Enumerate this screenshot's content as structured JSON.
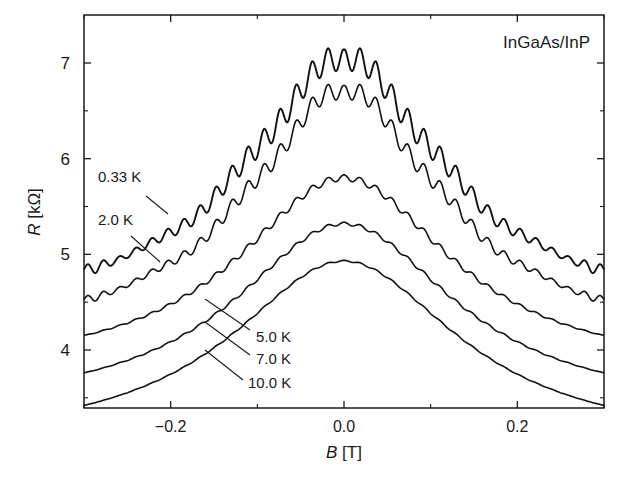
{
  "chart_data": {
    "type": "line",
    "title": "",
    "annotation": "InGaAs/InP",
    "xlabel": "B [T]",
    "xlabel_var": "B",
    "xlabel_unit": " [T]",
    "ylabel": "R [kΩ]",
    "ylabel_var": "R",
    "ylabel_unit": " [kΩ]",
    "xlim": [
      -0.3,
      0.3
    ],
    "ylim": [
      3.4,
      7.5
    ],
    "x_ticks": [
      -0.2,
      0.0,
      0.2
    ],
    "x_tick_labels": [
      "−0.2",
      "0.0",
      "0.2"
    ],
    "x_minor_ticks": [
      -0.3,
      -0.1,
      0.1,
      0.3
    ],
    "y_ticks": [
      4,
      5,
      6,
      7
    ],
    "y_tick_labels": [
      "4",
      "5",
      "6",
      "7"
    ],
    "y_minor_ticks": [
      3.5,
      4.5,
      5.5,
      6.5
    ],
    "grid": false,
    "legend": "inline labels with leader lines",
    "series": [
      {
        "name": "0.33 K",
        "peak": 7.02,
        "edge": 4.83,
        "width": 0.14,
        "osc_amp": 0.13,
        "osc_period": 0.0185,
        "label_xy": [
          98,
          182
        ],
        "leader": [
          [
            146,
            196
          ],
          [
            168,
            214
          ]
        ]
      },
      {
        "name": "2.0 K",
        "peak": 6.68,
        "edge": 4.52,
        "width": 0.14,
        "osc_amp": 0.09,
        "osc_period": 0.0185,
        "label_xy": [
          98,
          225
        ],
        "leader": [
          [
            131,
            236
          ],
          [
            160,
            262
          ]
        ]
      },
      {
        "name": "5.0 K",
        "peak": 5.8,
        "edge": 4.15,
        "width": 0.15,
        "osc_amp": 0.035,
        "osc_period": 0.0185,
        "label_xy": [
          256,
          342
        ],
        "leader": [
          [
            205,
            299
          ],
          [
            250,
            330
          ]
        ]
      },
      {
        "name": "7.0 K",
        "peak": 5.32,
        "edge": 3.76,
        "width": 0.155,
        "osc_amp": 0.018,
        "osc_period": 0.0185,
        "label_xy": [
          256,
          364
        ],
        "leader": [
          [
            205,
            322
          ],
          [
            250,
            355
          ]
        ]
      },
      {
        "name": "10.0 K",
        "peak": 4.93,
        "edge": 3.42,
        "width": 0.16,
        "osc_amp": 0.008,
        "osc_period": 0.0185,
        "label_xy": [
          248,
          388
        ],
        "leader": [
          [
            205,
            350
          ],
          [
            243,
            380
          ]
        ]
      }
    ]
  }
}
